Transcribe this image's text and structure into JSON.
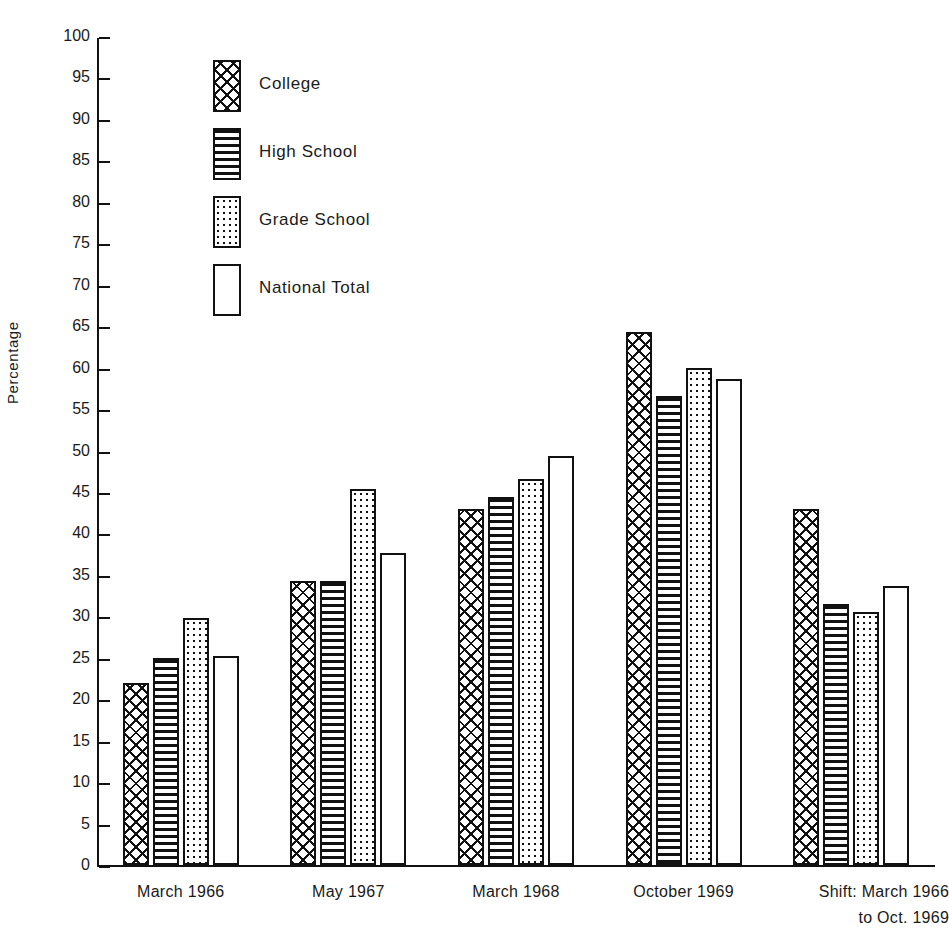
{
  "chart_data": {
    "type": "bar",
    "title": "",
    "xlabel": "",
    "ylabel": "Percentage",
    "ylim": [
      0,
      100
    ],
    "ytick_step": 5,
    "grid": false,
    "legend_position": "upper-left-inside",
    "categories": [
      "March 1966",
      "May 1967",
      "March 1968",
      "October 1969",
      "Shift: March 1966 to Oct. 1969"
    ],
    "category_labels": [
      {
        "line1": "March 1966",
        "line2": ""
      },
      {
        "line1": "May 1967",
        "line2": ""
      },
      {
        "line1": "March 1968",
        "line2": ""
      },
      {
        "line1": "October 1969",
        "line2": ""
      },
      {
        "line1": "Shift: March 1966",
        "line2": "to Oct. 1969"
      }
    ],
    "yticks": [
      0,
      5,
      10,
      15,
      20,
      25,
      30,
      35,
      40,
      45,
      50,
      55,
      60,
      65,
      70,
      75,
      80,
      85,
      90,
      95,
      100
    ],
    "series": [
      {
        "name": "College",
        "pattern": "cross-hatch",
        "values": [
          22.0,
          34.2,
          43.0,
          64.3,
          43.0
        ]
      },
      {
        "name": "High School",
        "pattern": "horizontal-lines",
        "values": [
          25.0,
          34.2,
          44.4,
          56.6,
          31.5
        ]
      },
      {
        "name": "Grade School",
        "pattern": "dots",
        "values": [
          29.8,
          45.3,
          46.6,
          60.0,
          30.5
        ]
      },
      {
        "name": "National Total",
        "pattern": "empty",
        "values": [
          25.2,
          37.6,
          49.3,
          58.6,
          33.6
        ]
      }
    ]
  },
  "legend": {
    "items": [
      {
        "label": "College",
        "swatch": "cross-hatch-swatch"
      },
      {
        "label": "High School",
        "swatch": "horizontal-lines-swatch"
      },
      {
        "label": "Grade School",
        "swatch": "dots-swatch"
      },
      {
        "label": "National Total",
        "swatch": "empty-swatch"
      }
    ]
  },
  "colors": {
    "ink": "#111111",
    "background": "#ffffff"
  }
}
